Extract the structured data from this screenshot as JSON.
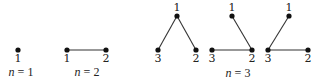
{
  "diagram": {
    "panels": [
      {
        "caption_var": "n",
        "caption_eq": " = ",
        "caption_val": "1",
        "trees": [
          {
            "nodes": [
              {
                "label": "1",
                "x": 18,
                "y": 50
              }
            ],
            "edges": []
          }
        ]
      },
      {
        "caption_var": "n",
        "caption_eq": " = ",
        "caption_val": "2",
        "trees": [
          {
            "nodes": [
              {
                "label": "1",
                "x": 67,
                "y": 50
              },
              {
                "label": "2",
                "x": 106,
                "y": 50
              }
            ],
            "edges": [
              [
                0,
                1
              ]
            ]
          }
        ]
      },
      {
        "caption_var": "n",
        "caption_eq": " = ",
        "caption_val": "3",
        "trees": [
          {
            "nodes": [
              {
                "label": "1",
                "x": 177,
                "y": 16
              },
              {
                "label": "3",
                "x": 158,
                "y": 50
              },
              {
                "label": "2",
                "x": 196,
                "y": 50
              }
            ],
            "edges": [
              [
                0,
                1
              ],
              [
                0,
                2
              ]
            ]
          },
          {
            "nodes": [
              {
                "label": "1",
                "x": 232,
                "y": 16
              },
              {
                "label": "3",
                "x": 212,
                "y": 50
              },
              {
                "label": "2",
                "x": 252,
                "y": 50
              }
            ],
            "edges": [
              [
                0,
                2
              ],
              [
                1,
                2
              ]
            ]
          },
          {
            "nodes": [
              {
                "label": "1",
                "x": 289,
                "y": 16
              },
              {
                "label": "3",
                "x": 268,
                "y": 50
              },
              {
                "label": "2",
                "x": 308,
                "y": 50
              }
            ],
            "edges": [
              [
                0,
                1
              ],
              [
                1,
                2
              ]
            ]
          }
        ]
      }
    ]
  }
}
